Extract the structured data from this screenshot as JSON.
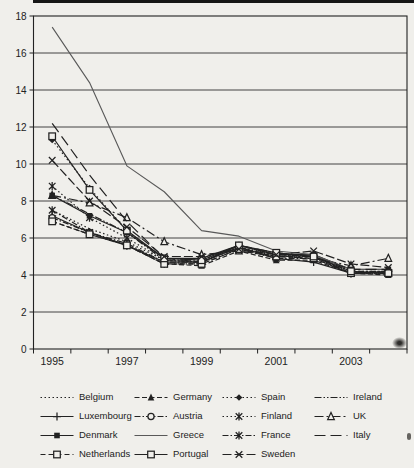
{
  "figure": {
    "background_color": "#f0efeb",
    "ink_color": "#222222",
    "grid_color": "#2f2f2f",
    "title": ""
  },
  "chart_data": {
    "type": "line",
    "title": "",
    "xlabel": "",
    "ylabel": "",
    "x": [
      1995,
      1996,
      1997,
      1998,
      1999,
      2000,
      2001,
      2002,
      2003,
      2004
    ],
    "x_tick_labels_shown": [
      "1995",
      "1997",
      "1999",
      "2001",
      "2003"
    ],
    "y_ticks": [
      0,
      2,
      4,
      6,
      8,
      10,
      12,
      14,
      16,
      18
    ],
    "ylim": [
      0,
      18
    ],
    "grid": "horizontal",
    "legend_position": "bottom",
    "legend_columns": 4,
    "series": [
      {
        "name": "Belgium",
        "dash": "1.5 2.5",
        "marker": "none",
        "values": [
          7.5,
          6.5,
          5.8,
          4.8,
          4.8,
          5.6,
          5.1,
          5.0,
          4.2,
          4.2
        ]
      },
      {
        "name": "Germany",
        "dash": "5 2.5",
        "marker": "triangle",
        "values": [
          6.9,
          6.2,
          5.6,
          4.6,
          4.5,
          5.3,
          4.8,
          4.8,
          4.1,
          4.0
        ]
      },
      {
        "name": "Spain",
        "dash": "1.5 2.5",
        "marker": "diamond",
        "values": [
          11.3,
          8.7,
          6.4,
          4.8,
          4.7,
          5.5,
          5.1,
          5.0,
          4.1,
          4.1
        ]
      },
      {
        "name": "Ireland",
        "dash": "7 2 1.5 2 1.5 2",
        "marker": "none",
        "values": [
          8.3,
          7.3,
          6.3,
          4.8,
          4.7,
          5.5,
          5.0,
          5.0,
          4.1,
          4.1
        ]
      },
      {
        "name": "Luxembourg",
        "dash": "",
        "marker": "plus",
        "values": [
          7.2,
          6.3,
          5.6,
          4.7,
          4.7,
          5.5,
          4.9,
          4.7,
          4.1,
          4.2
        ]
      },
      {
        "name": "Austria",
        "dash": "6 2 1.5 2",
        "marker": "circle-open",
        "values": [
          7.1,
          6.3,
          5.7,
          4.7,
          4.7,
          5.6,
          5.1,
          5.0,
          4.2,
          4.2
        ]
      },
      {
        "name": "Finland",
        "dash": "1.5 2.5",
        "marker": "star",
        "values": [
          8.8,
          7.1,
          6.0,
          4.8,
          4.7,
          5.5,
          5.0,
          5.0,
          4.1,
          4.1
        ]
      },
      {
        "name": "UK",
        "dash": "9 3 2 3",
        "marker": "triangle-open",
        "values": [
          8.3,
          7.9,
          7.1,
          5.8,
          5.1,
          5.3,
          5.0,
          4.9,
          4.5,
          4.9
        ]
      },
      {
        "name": "Denmark",
        "dash": "",
        "marker": "square",
        "values": [
          8.3,
          7.2,
          6.3,
          4.9,
          4.9,
          5.6,
          5.1,
          5.1,
          4.3,
          4.3
        ]
      },
      {
        "name": "Greece",
        "dash": "",
        "marker": "none",
        "color": "#595959",
        "width": 1.1,
        "values": [
          17.4,
          14.4,
          9.9,
          8.5,
          6.4,
          6.1,
          5.3,
          5.1,
          4.3,
          4.3
        ]
      },
      {
        "name": "France",
        "dash": "6 2 1.5 2",
        "marker": "star",
        "values": [
          7.5,
          6.3,
          5.6,
          4.6,
          4.6,
          5.4,
          4.9,
          4.9,
          4.1,
          4.1
        ]
      },
      {
        "name": "Italy",
        "dash": "11 5",
        "marker": "none",
        "values": [
          12.2,
          9.4,
          6.9,
          4.9,
          4.7,
          5.6,
          5.2,
          5.0,
          4.3,
          4.3
        ]
      },
      {
        "name": "Netherlands",
        "dash": "5 3",
        "marker": "square-open",
        "values": [
          6.9,
          6.2,
          5.6,
          4.6,
          4.6,
          5.4,
          5.0,
          4.9,
          4.1,
          4.1
        ]
      },
      {
        "name": "Portugal",
        "dash": "",
        "marker": "square-open",
        "values": [
          11.5,
          8.6,
          6.4,
          4.9,
          4.8,
          5.6,
          5.2,
          5.0,
          4.2,
          4.1
        ]
      },
      {
        "name": "Sweden",
        "dash": "9 3",
        "marker": "x",
        "values": [
          10.2,
          8.0,
          6.6,
          5.0,
          5.0,
          5.4,
          5.1,
          5.3,
          4.6,
          4.4
        ]
      }
    ]
  }
}
